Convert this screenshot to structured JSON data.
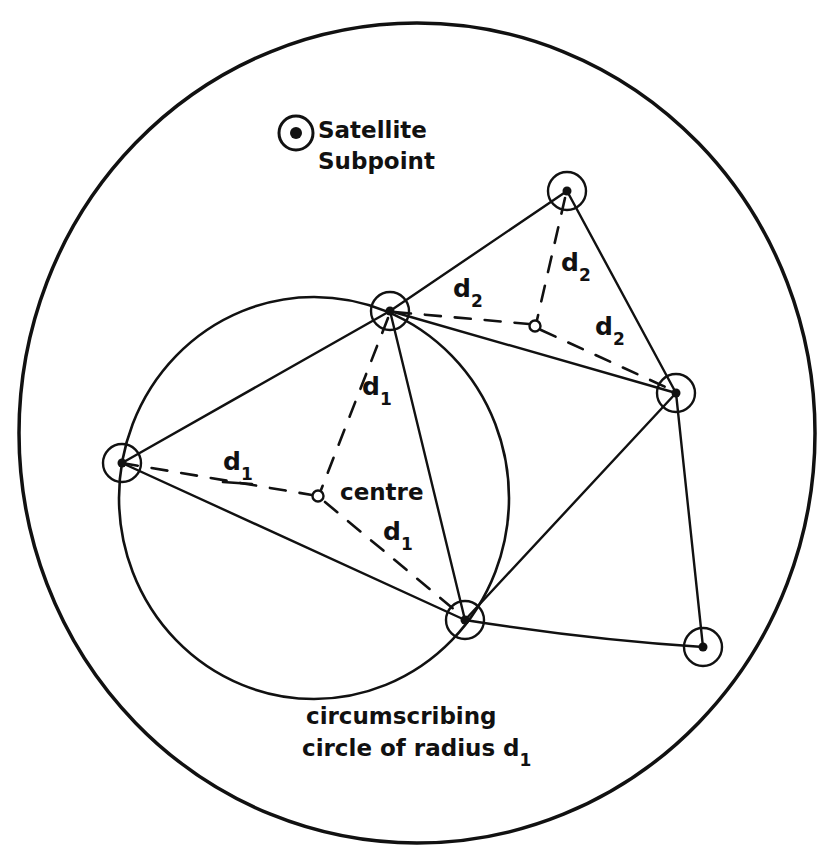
{
  "diagram": {
    "legend": {
      "line1": "Satellite",
      "line2": "Subpoint",
      "icon": "satellite-subpoint-icon"
    },
    "labels": {
      "centre": "centre",
      "d": "d",
      "sub1": "1",
      "sub2": "2",
      "caption_line1": "circumscribing",
      "caption_line2": "circle of radius d",
      "caption_sub": "1"
    },
    "outer_region": {
      "cx": 417,
      "cy": 433,
      "rx": 398,
      "ry": 410
    },
    "circumscribing_circle": {
      "cx": 314,
      "cy": 498,
      "rx": 195,
      "ry": 201
    },
    "subpoints": [
      {
        "id": "A",
        "x": 122,
        "y": 463
      },
      {
        "id": "B",
        "x": 390,
        "y": 311
      },
      {
        "id": "C",
        "x": 465,
        "y": 620
      },
      {
        "id": "D",
        "x": 567,
        "y": 191
      },
      {
        "id": "E",
        "x": 676,
        "y": 393
      },
      {
        "id": "F",
        "x": 703,
        "y": 647
      }
    ],
    "centres": [
      {
        "id": "centre1",
        "x": 318,
        "y": 496,
        "radius_label": "d1"
      },
      {
        "id": "centre2",
        "x": 535,
        "y": 326,
        "radius_label": "d2"
      }
    ],
    "edges": [
      [
        "A",
        "B"
      ],
      [
        "A",
        "C"
      ],
      [
        "B",
        "C"
      ],
      [
        "B",
        "D"
      ],
      [
        "B",
        "E"
      ],
      [
        "D",
        "E"
      ],
      [
        "C",
        "E"
      ],
      [
        "E",
        "F"
      ],
      [
        "C",
        "F"
      ]
    ],
    "colors": {
      "ink": "#111111",
      "paper": "#ffffff"
    }
  }
}
